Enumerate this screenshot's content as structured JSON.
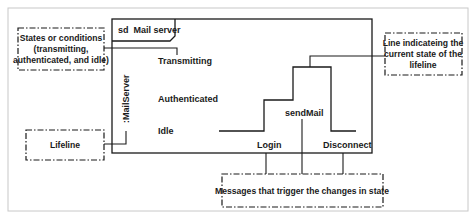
{
  "diagram": {
    "type": "UML timing diagram",
    "frame_label": "sd  Mail server",
    "lifeline": ":MailServer",
    "states": [
      "Transmitting",
      "Authenticated",
      "Idle"
    ],
    "messages": [
      "Login",
      "sendMail",
      "Disconnect"
    ],
    "timeline": [
      {
        "state": "Idle"
      },
      {
        "message": "Login",
        "to": "Authenticated"
      },
      {
        "message": "sendMail",
        "to": "Transmitting"
      },
      {
        "message": "Disconnect",
        "to": "Idle"
      }
    ]
  },
  "annotations": {
    "states_note": [
      "States or conditions",
      "(transmitting,",
      "authenticated, and idle)"
    ],
    "lifeline_note": "Lifeline",
    "current_state_note": [
      "Line indicateing the",
      "current state of the",
      "lifeline"
    ],
    "messages_note": "Messages that trigger the changes in state"
  },
  "colors": {
    "line": "#1a1a1a",
    "outer_border": "#c8c8c8"
  }
}
